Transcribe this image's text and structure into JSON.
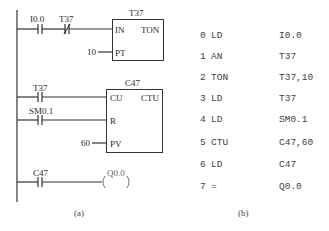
{
  "ladder": {
    "rung1": {
      "contact1": "I0.0",
      "contact2": "T37",
      "block_name": "T37",
      "block_type": "TON",
      "pin_in": "IN",
      "pin_pt": "PT",
      "pt_value": "10"
    },
    "rung2": {
      "contact_cu": "T37",
      "contact_r": "SM0.1",
      "block_name": "C47",
      "block_type": "CTU",
      "pin_cu": "CU",
      "pin_r": "R",
      "pin_pv": "PV",
      "pv_value": "60"
    },
    "rung3": {
      "contact": "C47",
      "coil": "Q0.0"
    },
    "caption": "(a)"
  },
  "instruction_list": {
    "rows": [
      {
        "step": "0",
        "op": "LD",
        "arg": "I0.0"
      },
      {
        "step": "1",
        "op": "AN",
        "arg": "T37"
      },
      {
        "step": "2",
        "op": "TON",
        "arg": "T37,10"
      },
      {
        "step": "3",
        "op": "LD",
        "arg": "T37"
      },
      {
        "step": "4",
        "op": "LD",
        "arg": "SM0.1"
      },
      {
        "step": "5",
        "op": "CTU",
        "arg": "C47,60"
      },
      {
        "step": "6",
        "op": "LD",
        "arg": "C47"
      },
      {
        "step": "7",
        "op": "=",
        "arg": "Q0.0"
      }
    ],
    "caption": "(b)"
  }
}
